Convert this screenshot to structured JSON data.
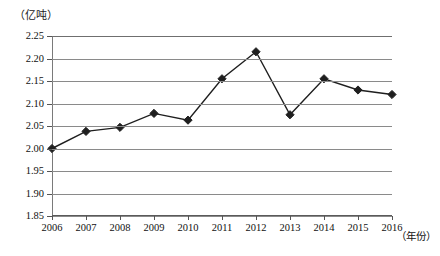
{
  "chart_data": {
    "type": "line",
    "title": "",
    "unit_label": "（亿吨）",
    "xlabel": "（年份）",
    "ylabel": "",
    "grid": true,
    "legend": false,
    "marker": "diamond",
    "line_color": "#1f1f1f",
    "grid_color": "#8a8a8a",
    "ylim": [
      1.85,
      2.25
    ],
    "ytick_step": 0.05,
    "categories": [
      "2006",
      "2007",
      "2008",
      "2009",
      "2010",
      "2011",
      "2012",
      "2013",
      "2014",
      "2015",
      "2016"
    ],
    "ytick_labels": [
      "2.25",
      "2.20",
      "2.15",
      "2.10",
      "2.05",
      "2.00",
      "1.95",
      "1.90",
      "1.85"
    ],
    "ytick_values": [
      2.25,
      2.2,
      2.15,
      2.1,
      2.05,
      2.0,
      1.95,
      1.9,
      1.85
    ],
    "values": [
      2.0,
      2.038,
      2.047,
      2.078,
      2.063,
      2.155,
      2.215,
      2.075,
      2.155,
      2.13,
      2.12
    ],
    "series": [
      {
        "name": "产量",
        "values": [
          2.0,
          2.038,
          2.047,
          2.078,
          2.063,
          2.155,
          2.215,
          2.075,
          2.155,
          2.13,
          2.12
        ]
      }
    ]
  }
}
